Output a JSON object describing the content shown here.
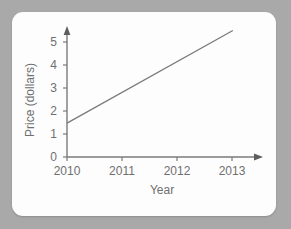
{
  "card": {
    "background_color": "#fdfdfd",
    "page_background_color": "#a9a9a9"
  },
  "chart_data": {
    "type": "line",
    "title": "",
    "xlabel": "Year",
    "ylabel": "Price (dollars)",
    "x_tick_labels": [
      "2010",
      "2011",
      "2012",
      "2013"
    ],
    "x_tick_values": [
      2010,
      2011,
      2012,
      2013
    ],
    "y_tick_labels": [
      "0",
      "1",
      "2",
      "3",
      "4",
      "5"
    ],
    "y_tick_values": [
      0,
      1,
      2,
      3,
      4,
      5
    ],
    "xlim": [
      2010,
      2013.15
    ],
    "ylim": [
      0,
      5.8
    ],
    "grid": false,
    "legend": false,
    "axis_arrows": [
      "x-right",
      "y-top"
    ],
    "line_color": "#7a7a7a",
    "series": [
      {
        "name": "Price",
        "x": [
          2010,
          2012.75
        ],
        "values": [
          1.5,
          5.6
        ],
        "slope_per_year": 1.49,
        "intercept_at_2010": 1.5
      }
    ]
  },
  "labels": {
    "y_axis_title": "Price (dollars)",
    "x_axis_title": "Year",
    "y_0": "0",
    "y_1": "1",
    "y_2": "2",
    "y_3": "3",
    "y_4": "4",
    "y_5": "5",
    "x_2010": "2010",
    "x_2011": "2011",
    "x_2012": "2012",
    "x_2013": "2013"
  }
}
